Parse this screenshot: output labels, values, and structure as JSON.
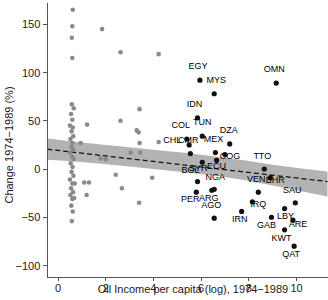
{
  "chart_data": {
    "type": "scatter",
    "title": "",
    "xlabel": "Oil Income per capita (log), 1974−1989",
    "ylabel": "Change 1974−1989 (%)",
    "xlim": [
      -0.45,
      11.3
    ],
    "ylim": [
      -112,
      172
    ],
    "xticks": [
      0,
      2,
      4,
      6,
      8,
      10
    ],
    "xticklabels": [
      "0",
      "2",
      "4",
      "6",
      "8",
      "10"
    ],
    "yticks": [
      -100,
      -50,
      0,
      50,
      100,
      150
    ],
    "yticklabels": [
      "−100",
      "−50",
      "0",
      "50",
      "100",
      "150"
    ],
    "grid": false,
    "legend": null,
    "colors": {
      "unlabeled_point": "#8a8a8a",
      "labeled_point": "#111111",
      "ci_band": "#b3b3b3",
      "fit_line": "#111111",
      "axis": "#555555",
      "background": "#ffffff"
    },
    "fit_line": {
      "style": "dashed",
      "x": [
        -0.45,
        11.3
      ],
      "y": [
        20.5,
        -13.0
      ]
    },
    "ci_band": {
      "x": [
        -0.45,
        0.6,
        1.8,
        3.0,
        4.2,
        5.4,
        6.6,
        7.8,
        9.0,
        10.2,
        11.3
      ],
      "upper": [
        31.5,
        28.5,
        25.5,
        22.5,
        19.5,
        16.5,
        13.0,
        9.0,
        4.5,
        0.5,
        -2.5
      ],
      "lower": [
        9.5,
        8.0,
        5.5,
        2.5,
        -0.5,
        -3.5,
        -7.0,
        -11.5,
        -17.0,
        -23.0,
        -28.5
      ]
    },
    "labeled_points": [
      {
        "label": "EGY",
        "x": 5.95,
        "y": 92,
        "lx": -2,
        "ly": -11
      },
      {
        "label": "MYS",
        "x": 6.55,
        "y": 78,
        "lx": 2,
        "ly": -11
      },
      {
        "label": "OMN",
        "x": 9.15,
        "y": 89,
        "lx": -2,
        "ly": -11
      },
      {
        "label": "IDN",
        "x": 5.85,
        "y": 53,
        "lx": -3,
        "ly": -11
      },
      {
        "label": "TUN",
        "x": 6.05,
        "y": 34,
        "lx": 0,
        "ly": -11
      },
      {
        "label": "COL",
        "x": 5.4,
        "y": 31,
        "lx": -6,
        "ly": -11
      },
      {
        "label": "CHL",
        "x": 5.5,
        "y": 25,
        "lx": -17,
        "ly": -2
      },
      {
        "label": "DZA",
        "x": 7.2,
        "y": 26,
        "lx": -1,
        "ly": -11
      },
      {
        "label": "MEX",
        "x": 6.6,
        "y": 17,
        "lx": -2,
        "ly": -11
      },
      {
        "label": "CMR",
        "x": 5.55,
        "y": 16,
        "lx": -2,
        "ly": -11
      },
      {
        "label": "COG",
        "x": 7.0,
        "y": 15,
        "lx": 5,
        "ly": 4
      },
      {
        "label": "ECU",
        "x": 6.65,
        "y": 9,
        "lx": 0,
        "ly": 9
      },
      {
        "label": "SYR",
        "x": 6.05,
        "y": 7,
        "lx": -4,
        "ly": 9
      },
      {
        "label": "TTO",
        "x": 8.65,
        "y": 0,
        "lx": -2,
        "ly": -10
      },
      {
        "label": "BHR",
        "x": 8.9,
        "y": -9,
        "lx": 5,
        "ly": 5
      },
      {
        "label": "BOL",
        "x": 5.85,
        "y": -13,
        "lx": -7,
        "ly": -9
      },
      {
        "label": "NGA",
        "x": 6.55,
        "y": -21,
        "lx": 1,
        "ly": -9
      },
      {
        "label": "VEN",
        "x": 8.4,
        "y": -24,
        "lx": -2,
        "ly": -10
      },
      {
        "label": "SAU",
        "x": 9.95,
        "y": -35,
        "lx": -3,
        "ly": -10
      },
      {
        "label": "PER",
        "x": 5.8,
        "y": -24,
        "lx": -6,
        "ly": 10
      },
      {
        "label": "ARG",
        "x": 6.45,
        "y": -22,
        "lx": -3,
        "ly": 11
      },
      {
        "label": "IRQ",
        "x": 8.15,
        "y": -34,
        "lx": 6,
        "ly": 5
      },
      {
        "label": "AGO",
        "x": 6.55,
        "y": -51,
        "lx": -3,
        "ly": -10
      },
      {
        "label": "IRN",
        "x": 7.7,
        "y": -44,
        "lx": -2,
        "ly": 11
      },
      {
        "label": "LBY",
        "x": 9.5,
        "y": -41,
        "lx": 1,
        "ly": 10
      },
      {
        "label": "GAB",
        "x": 8.95,
        "y": -50,
        "lx": -5,
        "ly": 11
      },
      {
        "label": "ARE",
        "x": 9.85,
        "y": -53,
        "lx": 5,
        "ly": 7
      },
      {
        "label": "KWT",
        "x": 9.5,
        "y": -63,
        "lx": -3,
        "ly": 11
      },
      {
        "label": "QAT",
        "x": 9.9,
        "y": -80,
        "lx": -3,
        "ly": 11
      }
    ],
    "unlabeled_points": [
      {
        "x": 0.62,
        "y": 165
      },
      {
        "x": 0.6,
        "y": 148
      },
      {
        "x": 0.58,
        "y": 136
      },
      {
        "x": 0.6,
        "y": 115
      },
      {
        "x": 1.85,
        "y": 145
      },
      {
        "x": 2.62,
        "y": 121
      },
      {
        "x": 3.42,
        "y": 62
      },
      {
        "x": 4.22,
        "y": 119
      },
      {
        "x": 0.58,
        "y": 67
      },
      {
        "x": 0.66,
        "y": 63
      },
      {
        "x": 0.55,
        "y": 57
      },
      {
        "x": 0.6,
        "y": 51
      },
      {
        "x": 0.5,
        "y": 45
      },
      {
        "x": 0.62,
        "y": 43
      },
      {
        "x": 0.57,
        "y": 39
      },
      {
        "x": 0.64,
        "y": 34
      },
      {
        "x": 0.52,
        "y": 31
      },
      {
        "x": 0.6,
        "y": 27
      },
      {
        "x": 0.56,
        "y": 23
      },
      {
        "x": 0.64,
        "y": 20
      },
      {
        "x": 0.5,
        "y": 17
      },
      {
        "x": 0.59,
        "y": 13
      },
      {
        "x": 0.66,
        "y": 10
      },
      {
        "x": 0.53,
        "y": 6
      },
      {
        "x": 0.61,
        "y": 2
      },
      {
        "x": 0.57,
        "y": -3
      },
      {
        "x": 0.65,
        "y": -7
      },
      {
        "x": 0.5,
        "y": -11
      },
      {
        "x": 0.6,
        "y": -15
      },
      {
        "x": 0.7,
        "y": -15
      },
      {
        "x": 0.55,
        "y": -20
      },
      {
        "x": 0.63,
        "y": -24
      },
      {
        "x": 0.52,
        "y": -27
      },
      {
        "x": 0.6,
        "y": -31
      },
      {
        "x": 0.68,
        "y": -30
      },
      {
        "x": 0.56,
        "y": -38
      },
      {
        "x": 0.62,
        "y": -44
      },
      {
        "x": 0.58,
        "y": -54
      },
      {
        "x": 1.22,
        "y": 46
      },
      {
        "x": 0.95,
        "y": 27
      },
      {
        "x": 1.2,
        "y": -27
      },
      {
        "x": 1.78,
        "y": 11
      },
      {
        "x": 2.0,
        "y": 10
      },
      {
        "x": 2.62,
        "y": 50
      },
      {
        "x": 2.42,
        "y": -6
      },
      {
        "x": 2.68,
        "y": -20
      },
      {
        "x": 3.05,
        "y": 17
      },
      {
        "x": 3.38,
        "y": 38
      },
      {
        "x": 3.3,
        "y": 40
      },
      {
        "x": 3.42,
        "y": 27
      },
      {
        "x": 3.45,
        "y": 17
      },
      {
        "x": 3.4,
        "y": -35
      },
      {
        "x": 3.95,
        "y": -9
      },
      {
        "x": 4.22,
        "y": 28
      },
      {
        "x": 1.1,
        "y": -14
      },
      {
        "x": 1.3,
        "y": -14
      }
    ]
  },
  "axis": {
    "x_title": "Oil Income per capita (log), 1974−1989",
    "y_title": "Change 1974−1989 (%)"
  }
}
